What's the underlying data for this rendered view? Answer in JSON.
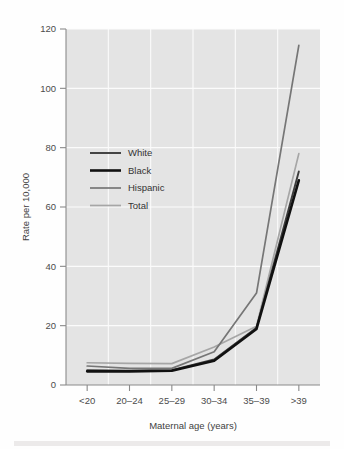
{
  "chart_data": {
    "type": "line",
    "title": "",
    "subtitle": "",
    "xlabel": "Maternal age (years)",
    "ylabel": "Rate per 10,000",
    "categories": [
      "<20",
      "20–24",
      "25–29",
      "30–34",
      "35–39",
      ">39"
    ],
    "x_tick_labels": [
      "<20",
      "20–24",
      "25–29",
      "30–34",
      "35–39",
      ">39"
    ],
    "y_tick_labels": [
      "0",
      "20",
      "40",
      "60",
      "80",
      "100",
      "120"
    ],
    "y_ticks": [
      0,
      20,
      40,
      60,
      80,
      100,
      120
    ],
    "ylim": [
      0,
      120
    ],
    "grid": true,
    "grid_color": "#fbfbfb",
    "panel_background": "#e4e4e4",
    "legend_position": "upper-left-inside",
    "series": [
      {
        "name": "White",
        "color": "#3c3c3c",
        "width": 1.9,
        "values": [
          5.0,
          4.8,
          5.0,
          8.6,
          19.3,
          72.0
        ]
      },
      {
        "name": "Black",
        "color": "#111111",
        "width": 2.6,
        "values": [
          4.6,
          4.6,
          4.8,
          8.2,
          18.9,
          69.0
        ]
      },
      {
        "name": "Hispanic",
        "color": "#767676",
        "width": 1.7,
        "values": [
          6.4,
          5.6,
          5.6,
          11.2,
          31.0,
          114.5
        ]
      },
      {
        "name": "Total",
        "color": "#a6a6a6",
        "width": 1.7,
        "values": [
          7.5,
          7.3,
          7.2,
          12.8,
          19.8,
          78.0
        ]
      }
    ]
  },
  "legend": {
    "entries": [
      {
        "label": "White"
      },
      {
        "label": "Black"
      },
      {
        "label": "Hispanic"
      },
      {
        "label": "Total"
      }
    ]
  }
}
